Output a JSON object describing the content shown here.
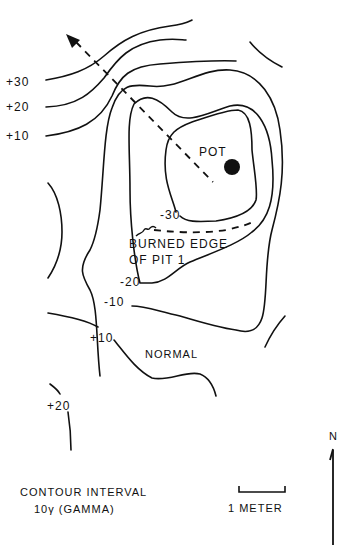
{
  "figure": {
    "type": "magnetometer contour map",
    "contour_labels": {
      "plus_30": "+30",
      "plus_20_top": "+20",
      "plus_10_top": "+10",
      "minus_30": "-30",
      "minus_20": "-20",
      "minus_10": "-10",
      "plus_10_bottom": "+10",
      "plus_20_bottom": "+20"
    },
    "annotations": {
      "pot": "POT",
      "burned_edge_line1": "BURNED EDGE",
      "burned_edge_line2": "OF PIT 1",
      "normal": "NORMAL"
    },
    "legend": {
      "contour_interval_line1": "CONTOUR INTERVAL",
      "contour_interval_line2": "10γ (GAMMA)",
      "scale_label": "1 METER",
      "north_label": "N"
    },
    "colors": {
      "ink": "#111111",
      "background": "#ffffff"
    }
  }
}
